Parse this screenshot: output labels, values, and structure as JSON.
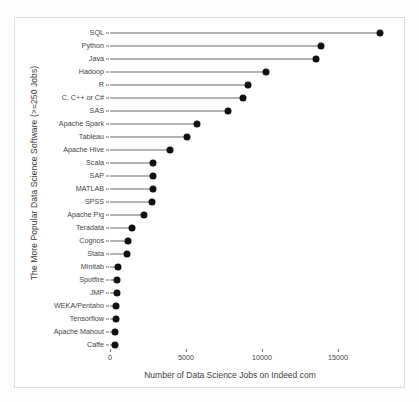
{
  "chart_data": {
    "type": "bar",
    "subtype": "lollipop-horizontal",
    "title": "",
    "xlabel": "Number of Data Science Jobs on Indeed com",
    "ylabel": "The More Popular Data Science Software (>=250 Jobs)",
    "xlim": [
      0,
      18500
    ],
    "xticks": [
      0,
      5000,
      10000,
      15000
    ],
    "xtick_labels": [
      "0",
      "5000",
      "10000",
      "15000"
    ],
    "grid": false,
    "legend": null,
    "marker_color": "#111111",
    "stem_color": "#6a6a6a",
    "categories": [
      "SQL",
      "Python",
      "Java",
      "Hadoop",
      "R",
      "C, C++ or C#",
      "SAS",
      "Apache Spark",
      "Tableau",
      "Apache Hive",
      "Scala",
      "SAP",
      "MATLAB",
      "SPSS",
      "Apache Pig",
      "Teradata",
      "Cognos",
      "Stata",
      "Minitab",
      "Spotfire",
      "JMP",
      "WEKA/Pentaho",
      "Tensorflow",
      "Apache Mahout",
      "Caffe"
    ],
    "values": [
      17760,
      13880,
      13550,
      10260,
      9080,
      8750,
      7760,
      5720,
      5060,
      3950,
      2830,
      2830,
      2830,
      2760,
      2240,
      1450,
      1180,
      1120,
      530,
      460,
      450,
      400,
      390,
      350,
      330
    ]
  },
  "figure": {
    "background": "#ffffff",
    "frame_color": "#dcdcdc"
  }
}
